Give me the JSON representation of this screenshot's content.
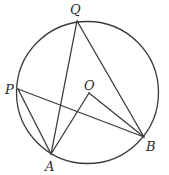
{
  "diagram": {
    "type": "circle-geometry",
    "circle": {
      "cx": 87.5,
      "cy": 92.5,
      "r": 71
    },
    "points": {
      "Q": {
        "label": "Q",
        "x": 77,
        "y": 21,
        "lx": 70,
        "ly": 14
      },
      "P": {
        "label": "P",
        "x": 18,
        "y": 89,
        "lx": 5,
        "ly": 94
      },
      "A": {
        "label": "A",
        "x": 51,
        "y": 154,
        "lx": 45,
        "ly": 171
      },
      "B": {
        "label": "B",
        "x": 144,
        "y": 137,
        "lx": 146,
        "ly": 151
      },
      "O": {
        "label": "O",
        "x": 89,
        "y": 93,
        "lx": 84,
        "ly": 90
      }
    },
    "segments": [
      [
        "P",
        "A"
      ],
      [
        "P",
        "B"
      ],
      [
        "Q",
        "A"
      ],
      [
        "Q",
        "B"
      ],
      [
        "A",
        "O"
      ],
      [
        "O",
        "B"
      ]
    ]
  }
}
